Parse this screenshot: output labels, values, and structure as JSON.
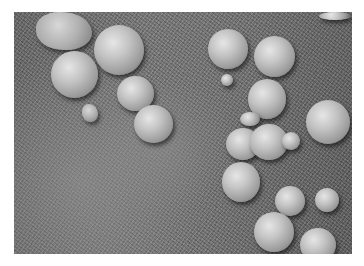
{
  "image": {
    "description": "Grayscale close-up photograph of small spherical concretions (spherules) resting on a granular rock surface",
    "spheres": [
      {
        "x": 22,
        "y": 0,
        "w": 56,
        "h": 38,
        "kind": "pebble"
      },
      {
        "x": 80,
        "y": 13,
        "w": 50,
        "h": 50,
        "kind": "sphere"
      },
      {
        "x": 37,
        "y": 39,
        "w": 47,
        "h": 47,
        "kind": "sphere"
      },
      {
        "x": 103,
        "y": 64,
        "w": 37,
        "h": 35,
        "kind": "sphere"
      },
      {
        "x": 120,
        "y": 93,
        "w": 39,
        "h": 38,
        "kind": "sphere"
      },
      {
        "x": 68,
        "y": 92,
        "w": 16,
        "h": 18,
        "kind": "pebble"
      },
      {
        "x": 194,
        "y": 17,
        "w": 40,
        "h": 40,
        "kind": "sphere"
      },
      {
        "x": 240,
        "y": 24,
        "w": 41,
        "h": 41,
        "kind": "sphere"
      },
      {
        "x": 207,
        "y": 62,
        "w": 12,
        "h": 12,
        "kind": "sphere"
      },
      {
        "x": 234,
        "y": 67,
        "w": 38,
        "h": 40,
        "kind": "sphere"
      },
      {
        "x": 292,
        "y": 88,
        "w": 44,
        "h": 44,
        "kind": "sphere"
      },
      {
        "x": 226,
        "y": 100,
        "w": 20,
        "h": 14,
        "kind": "sphere"
      },
      {
        "x": 212,
        "y": 116,
        "w": 34,
        "h": 32,
        "kind": "sphere"
      },
      {
        "x": 236,
        "y": 112,
        "w": 38,
        "h": 36,
        "kind": "sphere"
      },
      {
        "x": 268,
        "y": 120,
        "w": 18,
        "h": 18,
        "kind": "sphere"
      },
      {
        "x": 208,
        "y": 150,
        "w": 38,
        "h": 40,
        "kind": "sphere"
      },
      {
        "x": 261,
        "y": 174,
        "w": 30,
        "h": 30,
        "kind": "sphere"
      },
      {
        "x": 301,
        "y": 176,
        "w": 24,
        "h": 24,
        "kind": "sphere"
      },
      {
        "x": 240,
        "y": 200,
        "w": 40,
        "h": 40,
        "kind": "sphere"
      },
      {
        "x": 286,
        "y": 216,
        "w": 36,
        "h": 34,
        "kind": "sphere"
      },
      {
        "x": 305,
        "y": 0,
        "w": 32,
        "h": 8,
        "kind": "sphere"
      }
    ]
  }
}
